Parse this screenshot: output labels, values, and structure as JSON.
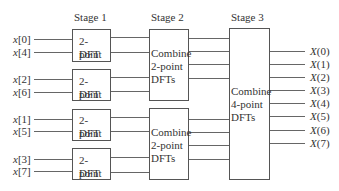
{
  "stages": [
    {
      "label": "Stage 1"
    },
    {
      "label": "Stage 2"
    },
    {
      "label": "Stage 3"
    }
  ],
  "inputs": [
    {
      "var": "x",
      "index": "[0]"
    },
    {
      "var": "x",
      "index": "[4]"
    },
    {
      "var": "x",
      "index": "[2]"
    },
    {
      "var": "x",
      "index": "[6]"
    },
    {
      "var": "x",
      "index": "[1]"
    },
    {
      "var": "x",
      "index": "[5]"
    },
    {
      "var": "x",
      "index": "[3]"
    },
    {
      "var": "x",
      "index": "[7]"
    }
  ],
  "stage1_boxes": [
    {
      "line1": "2-point",
      "line2": "DFT"
    },
    {
      "line1": "2-point",
      "line2": "DFT"
    },
    {
      "line1": "2-point",
      "line2": "DFT"
    },
    {
      "line1": "2-point",
      "line2": "DFT"
    }
  ],
  "stage2_boxes": [
    {
      "line1": "Combine",
      "line2": "2-point",
      "line3": "DFTs"
    },
    {
      "line1": "Combine",
      "line2": "2-point",
      "line3": "DFTs"
    }
  ],
  "stage3_box": {
    "line1": "Combine",
    "line2": "4-point",
    "line3": "DFTs"
  },
  "outputs": [
    {
      "var": "X",
      "index": "(0)"
    },
    {
      "var": "X",
      "index": "(1)"
    },
    {
      "var": "X",
      "index": "(2)"
    },
    {
      "var": "X",
      "index": "(3)"
    },
    {
      "var": "X",
      "index": "(4)"
    },
    {
      "var": "X",
      "index": "(5)"
    },
    {
      "var": "X",
      "index": "(6)"
    },
    {
      "var": "X",
      "index": "(7)"
    }
  ],
  "colors": {
    "line": "#555555",
    "text": "#333333",
    "background": "#ffffff"
  }
}
